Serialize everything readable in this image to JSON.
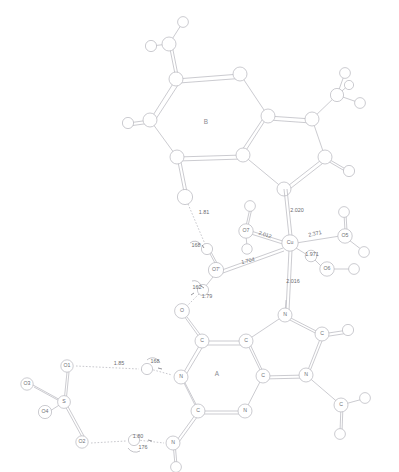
{
  "figure": {
    "ring_labels": {
      "top_unit": "B",
      "bottom_unit": "A"
    }
  },
  "chart_data": {
    "type": "diagram",
    "xlabel": "",
    "ylabel": "",
    "annotations": [
      {
        "label": "B",
        "kind": "ring-label",
        "x": 206,
        "y": 122
      },
      {
        "label": "A",
        "kind": "ring-label",
        "x": 217,
        "y": 374
      }
    ],
    "atom_labels": [
      {
        "label": "O7",
        "x": 246,
        "y": 231
      },
      {
        "label": "Cu",
        "x": 290,
        "y": 243
      },
      {
        "label": "O5",
        "x": 345,
        "y": 236
      },
      {
        "label": "O6",
        "x": 327,
        "y": 269
      },
      {
        "label": "O7'",
        "x": 216,
        "y": 270
      },
      {
        "label": "O",
        "x": 182,
        "y": 311
      },
      {
        "label": "N",
        "x": 285,
        "y": 315
      },
      {
        "label": "C",
        "x": 202,
        "y": 341
      },
      {
        "label": "C",
        "x": 246,
        "y": 341
      },
      {
        "label": "C",
        "x": 322,
        "y": 334
      },
      {
        "label": "N",
        "x": 181,
        "y": 377
      },
      {
        "label": "C",
        "x": 263,
        "y": 376
      },
      {
        "label": "N",
        "x": 306,
        "y": 375
      },
      {
        "label": "C",
        "x": 198,
        "y": 411
      },
      {
        "label": "N",
        "x": 245,
        "y": 411
      },
      {
        "label": "C",
        "x": 341,
        "y": 405
      },
      {
        "label": "N",
        "x": 173,
        "y": 443
      },
      {
        "label": "O1",
        "x": 67,
        "y": 366
      },
      {
        "label": "O2",
        "x": 82,
        "y": 442
      },
      {
        "label": "O3",
        "x": 27,
        "y": 384
      },
      {
        "label": "O4",
        "x": 45,
        "y": 412
      },
      {
        "label": "S",
        "x": 64,
        "y": 402
      }
    ],
    "bond_distances": [
      {
        "value": "1.81",
        "x": 204,
        "y": 213,
        "rotate": 0,
        "type": "hydrogen-bond"
      },
      {
        "value": "2.020",
        "x": 297,
        "y": 211,
        "rotate": 0,
        "type": "coordination-bond"
      },
      {
        "value": "2.012",
        "x": 265,
        "y": 235,
        "rotate": 18,
        "type": "coordination-bond"
      },
      {
        "value": "2.371",
        "x": 315,
        "y": 234,
        "rotate": -12,
        "type": "coordination-bond"
      },
      {
        "value": "1.971",
        "x": 312,
        "y": 255,
        "rotate": 0,
        "type": "coordination-bond"
      },
      {
        "value": "2.016",
        "x": 293,
        "y": 282,
        "rotate": 0,
        "type": "coordination-bond"
      },
      {
        "value": "1.704",
        "x": 248,
        "y": 261,
        "rotate": -13,
        "type": "coordination-bond"
      },
      {
        "value": "1.79",
        "x": 207,
        "y": 297,
        "rotate": 0,
        "type": "hydrogen-bond"
      },
      {
        "value": "1.85",
        "x": 119,
        "y": 364,
        "rotate": 0,
        "type": "hydrogen-bond"
      },
      {
        "value": "1.80",
        "x": 138,
        "y": 437,
        "rotate": 0,
        "type": "hydrogen-bond"
      }
    ],
    "bond_angles": [
      {
        "value": "168",
        "x": 196,
        "y": 246
      },
      {
        "value": "162",
        "x": 197,
        "y": 288
      },
      {
        "value": "168",
        "x": 155,
        "y": 362
      },
      {
        "value": "176",
        "x": 143,
        "y": 448
      }
    ]
  }
}
